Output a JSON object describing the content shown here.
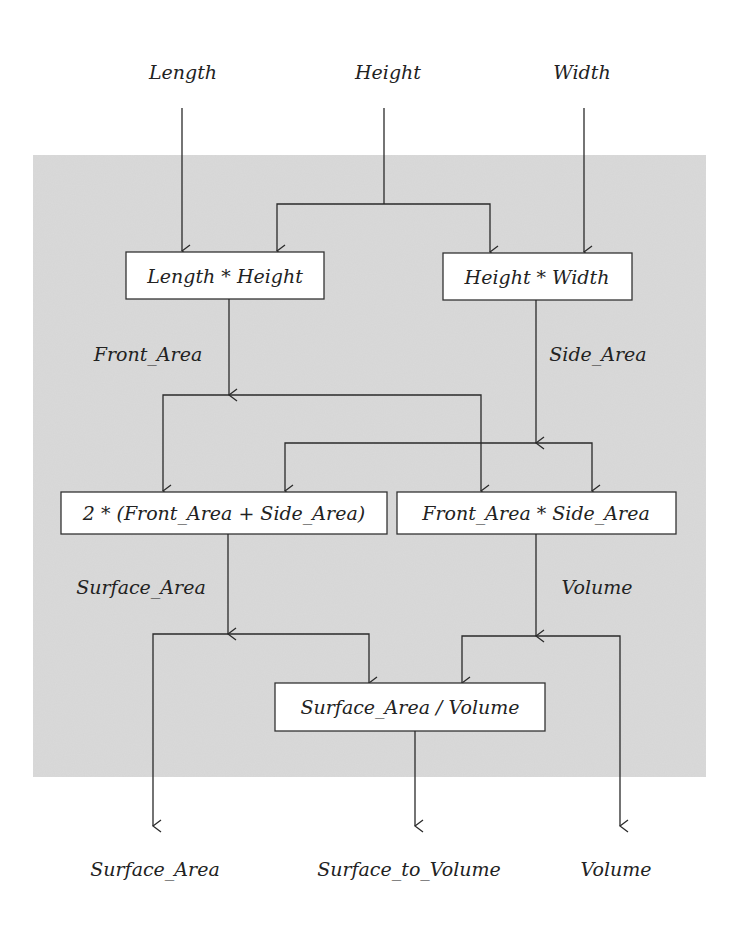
{
  "colors": {
    "background": "#ffffff",
    "panel": "#d6d6d6",
    "line": "#2a2a2a",
    "box_fill": "#ffffff"
  },
  "inputs": [
    {
      "id": "length",
      "label": "Length"
    },
    {
      "id": "height",
      "label": "Height"
    },
    {
      "id": "width",
      "label": "Width"
    }
  ],
  "nodes": [
    {
      "id": "front",
      "label": "Length * Height"
    },
    {
      "id": "side",
      "label": "Height * Width"
    },
    {
      "id": "surface",
      "label": "2 * (Front_Area + Side_Area)"
    },
    {
      "id": "volume",
      "label": "Front_Area * Side_Area"
    },
    {
      "id": "ratio",
      "label": "Surface_Area / Volume"
    }
  ],
  "edge_labels": {
    "front_area": "Front_Area",
    "side_area": "Side_Area",
    "surface_area": "Surface_Area",
    "volume": "Volume"
  },
  "outputs": [
    {
      "id": "surface_area",
      "label": "Surface_Area"
    },
    {
      "id": "surface_to_volume",
      "label": "Surface_to_Volume"
    },
    {
      "id": "volume",
      "label": "Volume"
    }
  ]
}
